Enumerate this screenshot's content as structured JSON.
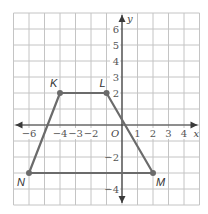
{
  "figure": {
    "x_range": [
      -7,
      5
    ],
    "y_range": [
      -5,
      7
    ],
    "x_axis_label": "x",
    "y_axis_label": "y",
    "origin_label": "O",
    "x_tick_labels": [
      {
        "value": -6,
        "text": "−6"
      },
      {
        "value": -4,
        "text": "−4"
      },
      {
        "value": -3,
        "text": "−3"
      },
      {
        "value": -2,
        "text": "−2"
      },
      {
        "value": 1,
        "text": "1"
      },
      {
        "value": 2,
        "text": "2"
      },
      {
        "value": 3,
        "text": "3"
      },
      {
        "value": 4,
        "text": "4"
      }
    ],
    "y_tick_labels": [
      {
        "value": 6,
        "text": "6"
      },
      {
        "value": 5,
        "text": "5"
      },
      {
        "value": 4,
        "text": "4"
      },
      {
        "value": 3,
        "text": "3"
      },
      {
        "value": 2,
        "text": "2"
      },
      {
        "value": -2,
        "text": "−2"
      },
      {
        "value": -4,
        "text": "−4"
      }
    ],
    "polygon": {
      "name": "KLMN",
      "vertices": [
        {
          "label": "K",
          "x": -4,
          "y": 2
        },
        {
          "label": "L",
          "x": -1,
          "y": 2
        },
        {
          "label": "M",
          "x": 2,
          "y": -3
        },
        {
          "label": "N",
          "x": -6,
          "y": -3
        }
      ]
    },
    "colors": {
      "grid": "#c4c4c4",
      "axis": "#3a3a3a",
      "polygon": "#6b6b6b"
    }
  }
}
